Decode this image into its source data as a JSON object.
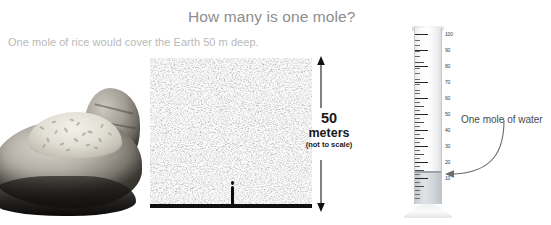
{
  "slide": {
    "title": "How many is one mole?",
    "subtitle": "One mole of rice would cover the Earth 50 m deep.",
    "background_color": "#ffffff",
    "title_color": "#8d8d8d",
    "subtitle_color": "#b9b9b9"
  },
  "hand_photo": {
    "name": "hand-holding-rice-photo",
    "description": "Cupped hand holding a small mound of rice",
    "style": "grayscale photograph"
  },
  "rice_field": {
    "name": "rice-field-panel",
    "description": "Dense field of rice grains covering the ground",
    "ground_line_color": "#101010",
    "person_label": "human figure for scale"
  },
  "dimension": {
    "value": "50",
    "unit": "meters",
    "note": "(not to scale)",
    "arrow": "double-headed vertical arrow",
    "text_color": "#1a1a1a"
  },
  "cylinder": {
    "name": "graduated-cylinder",
    "unit_max": 100,
    "tick_labels": [
      "100",
      "90",
      "80",
      "70",
      "60",
      "50",
      "40",
      "30",
      "20",
      "10"
    ],
    "tick_values": [
      100,
      90,
      80,
      70,
      60,
      50,
      40,
      30,
      20,
      10
    ],
    "fill_level": 18,
    "fill_color": "#d2d6da",
    "glass_color": "#eceef0"
  },
  "callout": {
    "label": "One mole of water",
    "arrow": "curved arrow pointing to cylinder water level",
    "text_color": "#4a4a4a"
  }
}
